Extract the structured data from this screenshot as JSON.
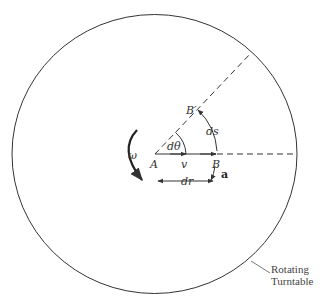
{
  "diagram": {
    "title": "",
    "labels": {
      "omega": "ω",
      "A": "A",
      "v": "v",
      "B": "B",
      "B_prime": "B′",
      "d_theta": "dθ",
      "ds": "ds",
      "dr": "dr",
      "a": "a",
      "turntable_line1": "Rotating",
      "turntable_line2": "Turntable"
    },
    "colors": {
      "line": "#333333",
      "background": "#ffffff"
    }
  }
}
